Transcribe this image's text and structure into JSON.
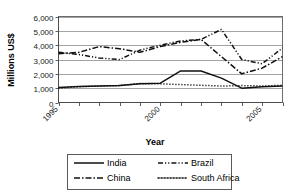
{
  "chart_data": {
    "type": "line",
    "title": "",
    "xlabel": "Year",
    "ylabel": "Millions US$",
    "xlim": [
      1995,
      2006
    ],
    "ylim": [
      0,
      6000
    ],
    "grid": true,
    "legend_position": "bottom",
    "y_ticks": [
      "0",
      "1,000",
      "2,000",
      "3,000",
      "4,000",
      "5,000",
      "6,000"
    ],
    "y_tick_values": [
      0,
      1000,
      2000,
      3000,
      4000,
      5000,
      6000
    ],
    "x_tick_labels": [
      "1995",
      "2000",
      "2005"
    ],
    "x_tick_values": [
      1995,
      2000,
      2005
    ],
    "x": [
      1995,
      1996,
      1997,
      1998,
      1999,
      2000,
      2001,
      2002,
      2003,
      2004,
      2005,
      2006
    ],
    "series": [
      {
        "name": "India",
        "style": "solid",
        "values": [
          1050,
          1120,
          1150,
          1180,
          1300,
          1350,
          2200,
          2200,
          1700,
          1000,
          1100,
          1150
        ]
      },
      {
        "name": "China",
        "style": "dash-dot",
        "values": [
          3400,
          3500,
          3900,
          3750,
          3500,
          3900,
          4200,
          4400,
          3200,
          2000,
          2400,
          3200
        ]
      },
      {
        "name": "Brazil",
        "style": "dash-dot-dot",
        "values": [
          3500,
          3350,
          3100,
          3000,
          3650,
          4000,
          4300,
          4400,
          5100,
          3000,
          2700,
          3800
        ]
      },
      {
        "name": "South Africa",
        "style": "dotted",
        "values": [
          1000,
          1100,
          1150,
          1180,
          1320,
          1300,
          1250,
          1200,
          1150,
          1180,
          1150,
          1200
        ]
      }
    ]
  },
  "legend": {
    "items": [
      {
        "label": "India",
        "style": "solid"
      },
      {
        "label": "Brazil",
        "style": "dash-dot-dot"
      },
      {
        "label": "China",
        "style": "dash-dot"
      },
      {
        "label": "South Africa",
        "style": "dotted"
      }
    ]
  },
  "axes": {
    "y_title": "Millions US$",
    "x_title": "Year"
  }
}
